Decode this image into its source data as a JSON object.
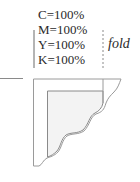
{
  "diagram": {
    "color_values": [
      {
        "label": "C=100%"
      },
      {
        "label": "M=100%"
      },
      {
        "label": "Y=100%"
      },
      {
        "label": "K=100%"
      }
    ],
    "fold_label": "fold",
    "colors": {
      "text": "#2a2a2a",
      "line": "#8a8a8a",
      "fill": "#f2f2f2"
    }
  }
}
